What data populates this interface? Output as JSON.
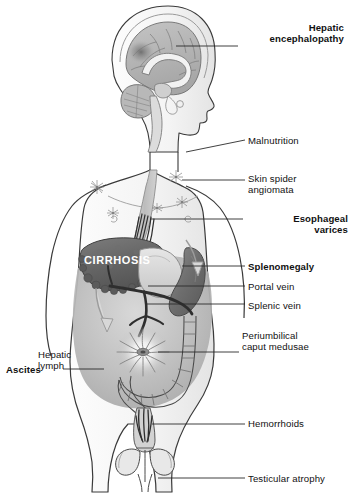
{
  "figure": {
    "view": "anterior male body with sagittal head section",
    "background_color": "#ffffff",
    "outline_color": "#333333",
    "organ_dark_color": "#6b6b6b",
    "organ_mid_color": "#9a9a9a",
    "organ_light_color": "#c9c9c9",
    "ascites_shade_color": "#b5b5b5",
    "leader_line_color": "#2b2b2b"
  },
  "organ_label": {
    "cirrhosis": "CIRRHOSIS",
    "cirrhosis_color": "#ffffff"
  },
  "inline_labels": [
    {
      "id": "hepatic-lymph",
      "text": "Hepatic\nlymph",
      "bold": false,
      "x": 38,
      "y": 349,
      "w": 62,
      "align": "left"
    }
  ],
  "labels": [
    {
      "id": "hepatic-encephalopathy",
      "text": "Hepatic\nencephalopathy",
      "bold": true,
      "side": "right",
      "x": 216,
      "y": 22,
      "w": 128,
      "align": "right",
      "leader": {
        "x1": 176,
        "y1": 46,
        "x2": 238,
        "y2": 46
      }
    },
    {
      "id": "malnutrition",
      "text": "Malnutrition",
      "bold": false,
      "side": "right",
      "x": 248,
      "y": 135,
      "w": 100,
      "align": "left",
      "leader": {
        "x1": 186,
        "y1": 152,
        "x2": 245,
        "y2": 140
      }
    },
    {
      "id": "skin-spider-angiomata",
      "text": "Skin spider\nangiomata",
      "bold": false,
      "side": "right",
      "x": 248,
      "y": 173,
      "w": 100,
      "align": "left",
      "leader": {
        "x1": 182,
        "y1": 180,
        "x2": 245,
        "y2": 180
      }
    },
    {
      "id": "esophageal-varices",
      "text": "Esophageal\nvarices",
      "bold": true,
      "side": "right",
      "x": 246,
      "y": 213,
      "w": 102,
      "align": "right",
      "leader": {
        "x1": 150,
        "y1": 219,
        "x2": 243,
        "y2": 219
      }
    },
    {
      "id": "splenomegaly",
      "text": "Splenomegaly",
      "bold": true,
      "side": "right",
      "x": 248,
      "y": 261,
      "w": 100,
      "align": "left",
      "leader": {
        "x1": 182,
        "y1": 266,
        "x2": 245,
        "y2": 266
      }
    },
    {
      "id": "portal-vein",
      "text": "Portal vein",
      "bold": false,
      "side": "right",
      "x": 248,
      "y": 281,
      "w": 100,
      "align": "left",
      "leader": {
        "x1": 148,
        "y1": 286,
        "x2": 245,
        "y2": 286
      }
    },
    {
      "id": "splenic-vein",
      "text": "Splenic vein",
      "bold": false,
      "side": "right",
      "x": 248,
      "y": 300,
      "w": 100,
      "align": "left",
      "leader": {
        "x1": 146,
        "y1": 304,
        "x2": 245,
        "y2": 304
      }
    },
    {
      "id": "periumbilical-caput-medusae",
      "text": "Periumbilical\ncaput medusae",
      "bold": false,
      "side": "right",
      "x": 242,
      "y": 330,
      "w": 106,
      "align": "left",
      "leader": {
        "x1": 158,
        "y1": 352,
        "x2": 239,
        "y2": 352
      }
    },
    {
      "id": "hemorrhoids",
      "text": "Hemorrhoids",
      "bold": false,
      "side": "right",
      "x": 248,
      "y": 418,
      "w": 100,
      "align": "left",
      "leader": {
        "x1": 152,
        "y1": 424,
        "x2": 245,
        "y2": 424
      }
    },
    {
      "id": "testicular-atrophy",
      "text": "Testicular atrophy",
      "bold": false,
      "side": "right",
      "x": 248,
      "y": 473,
      "w": 100,
      "align": "left",
      "leader": {
        "x1": 158,
        "y1": 478,
        "x2": 245,
        "y2": 478
      }
    },
    {
      "id": "ascites",
      "text": "Ascites",
      "bold": true,
      "side": "left",
      "x": 6,
      "y": 364,
      "w": 56,
      "align": "left",
      "leader": {
        "x1": 63,
        "y1": 369,
        "x2": 104,
        "y2": 369
      }
    }
  ],
  "anatomy_parts": [
    "head-sagittal-section",
    "cerebrum",
    "corpus-callosum",
    "cerebellum",
    "brainstem",
    "encephalopathy-shadow",
    "torso-outline",
    "esophagus",
    "esophageal-varices-veins",
    "liver-cirrhotic",
    "stomach",
    "spleen-enlarged",
    "portal-vein",
    "splenic-vein",
    "superior-mesenteric-vein",
    "ascites-fluid",
    "caput-medusae",
    "umbilicus",
    "colon",
    "rectum",
    "hemorrhoidal-veins",
    "testes",
    "spider-angioma-marks",
    "hepatic-lymph-arrow"
  ]
}
